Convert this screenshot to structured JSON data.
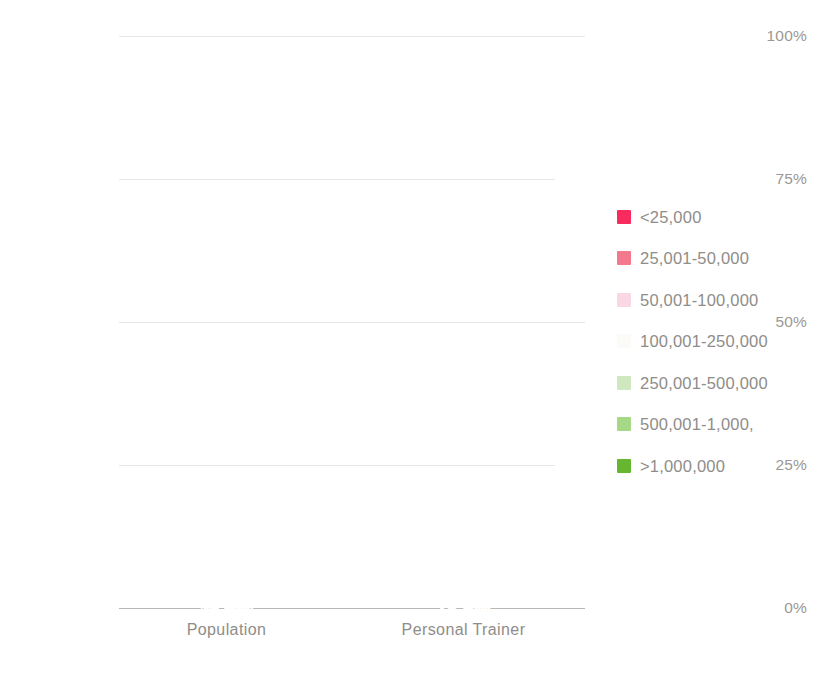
{
  "chart_data": {
    "type": "bar",
    "subtype": "stacked-100-percent",
    "title": "",
    "xlabel": "",
    "ylabel": "",
    "categories": [
      "Population",
      "Personal Trainer"
    ],
    "ylim": [
      0,
      100
    ],
    "ytick_labels": [
      "0%",
      "25%",
      "50%",
      "75%",
      "100%"
    ],
    "ytick_values": [
      0,
      25,
      50,
      75,
      100
    ],
    "grid": true,
    "legend_position": "right",
    "decimal_separator": ",",
    "value_label_suffix": "%",
    "series": [
      {
        "name": "<25,000",
        "color": "#f72b5d",
        "values": [
          46.8,
          15.0
        ],
        "labels": [
          "46,8%",
          "15,0%"
        ]
      },
      {
        "name": "25,001-50,000",
        "color": "#f2798e",
        "values": [
          13.3,
          12.3
        ],
        "labels": [
          "13,3%",
          "12,3%"
        ]
      },
      {
        "name": "50,001-100,000",
        "color": "#fad7e4",
        "values": [
          9.1,
          11.0
        ],
        "labels": [
          "9,1%",
          "11,0%"
        ]
      },
      {
        "name": "100,001-250,000",
        "color": "#fcfbf8",
        "values": [
          9.9,
          11.2
        ],
        "labels": [
          "",
          ""
        ]
      },
      {
        "name": "250,001-500,000",
        "color": "#cfe8c0",
        "values": [
          5.3,
          12.6
        ],
        "labels": [
          "5,3%",
          "12,6%"
        ]
      },
      {
        "name": "500,001-1,000,000",
        "color": "#a6d987",
        "values": [
          6.3,
          13.0
        ],
        "labels": [
          "6,3%",
          "13,0%"
        ]
      },
      {
        "name": ">1,000,000",
        "color": "#67b62f",
        "values": [
          9.3,
          24.9
        ],
        "labels": [
          "9,3%",
          "24,9%"
        ]
      }
    ]
  },
  "legend": {
    "entries": [
      {
        "label": "<25,000",
        "color": "#f72b5d"
      },
      {
        "label": "25,001-50,000",
        "color": "#f2798e"
      },
      {
        "label": "50,001-100,000",
        "color": "#fad7e4"
      },
      {
        "label": "100,001-250,000",
        "color": "#fcfbf8"
      },
      {
        "label": "250,001-500,000",
        "color": "#cfe8c0"
      },
      {
        "label": "500,001-1,000,",
        "color": "#a6d987"
      },
      {
        "label": ">1,000,000",
        "color": "#67b62f"
      }
    ]
  },
  "axis": {
    "y_ticks": [
      "100%",
      "75%",
      "50%",
      "25%",
      "0%"
    ],
    "x_categories": [
      "Population",
      "Personal Trainer"
    ]
  },
  "colors": {
    "grid": "#e8e6e2",
    "axis": "#b9b7b3",
    "tick_text": "#9b9893",
    "category_text": "#8f8d89",
    "legend_text": "#8f8d89",
    "value_text": "#ffffff",
    "background": "#ffffff"
  }
}
